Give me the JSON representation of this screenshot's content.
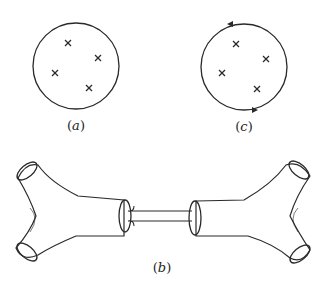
{
  "panels": {
    "a": {
      "label": "(a)",
      "open": "(",
      "letter": "a",
      "close": ")",
      "marker_count": 4,
      "marker_symbol": "cross",
      "contour": "none",
      "orientation": "none"
    },
    "b": {
      "label": "(b)",
      "open": "(",
      "letter": "b",
      "close": ")",
      "description": "Two Y-shaped tubular surfaces (pants), each with three open circular ends, joined by a thin connecting tube"
    },
    "c": {
      "label": "(c)",
      "open": "(",
      "letter": "c",
      "close": ")",
      "marker_count": 4,
      "marker_symbol": "cross",
      "contour": "oriented circle",
      "orientation": "counterclockwise"
    }
  },
  "colors": {
    "ink": "#2a2a2a",
    "background": "#ffffff",
    "stipple": "#555555"
  }
}
